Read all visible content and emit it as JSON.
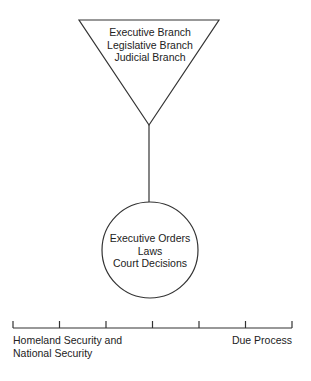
{
  "triangle": {
    "lines": [
      "Executive Branch",
      "Legislative Branch",
      "Judicial Branch"
    ]
  },
  "circle": {
    "lines": [
      "Executive Orders",
      "Laws",
      "Court Decisions"
    ]
  },
  "scale": {
    "tick_count": 7,
    "left_label": [
      "Homeland Security and",
      "National Security"
    ],
    "right_label": "Due Process"
  },
  "colors": {
    "stroke": "#333333",
    "background": "#ffffff"
  }
}
